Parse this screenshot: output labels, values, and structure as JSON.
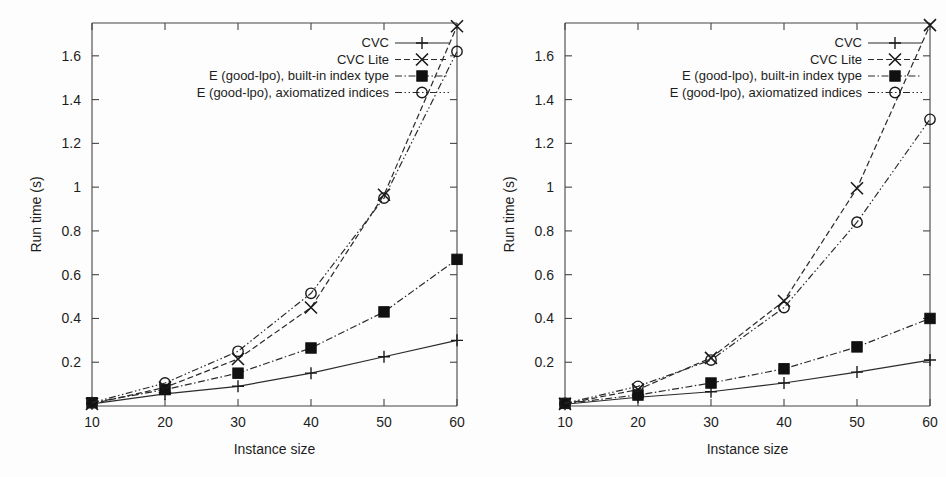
{
  "figure": {
    "background": "#fdfdfd",
    "ink_color": "#1d1d1d",
    "panel_count": 2
  },
  "legend": {
    "entries": [
      {
        "label": "CVC",
        "marker": "plus",
        "line_style": "solid"
      },
      {
        "label": "CVC Lite",
        "marker": "cross",
        "line_style": "dashed"
      },
      {
        "label": "E (good-lpo), built-in index type",
        "marker": "filled-square",
        "line_style": "dash-dot"
      },
      {
        "label": "E (good-lpo), axiomatized indices",
        "marker": "open-circle",
        "line_style": "dash-dot-dot"
      }
    ]
  },
  "chart_data": [
    {
      "panel": "left",
      "type": "line",
      "title": "",
      "xlabel": "Instance size",
      "ylabel": "Run time (s)",
      "x": [
        10,
        20,
        30,
        40,
        50,
        60
      ],
      "xticklabels": [
        "10",
        "20",
        "30",
        "40",
        "50",
        "60"
      ],
      "xlim": [
        10,
        60
      ],
      "ylim": [
        0,
        1.75
      ],
      "yticks": [
        0.2,
        0.4,
        0.6,
        0.8,
        1,
        1.2,
        1.4,
        1.6
      ],
      "yticklabels": [
        "0.2",
        "0.4",
        "0.6",
        "0.8",
        "1",
        "1.2",
        "1.4",
        "1.6"
      ],
      "grid": false,
      "legend_position": "top-right inside",
      "series": [
        {
          "name": "CVC",
          "marker": "plus",
          "line_style": "solid",
          "values": [
            0.01,
            0.055,
            0.09,
            0.15,
            0.225,
            0.3
          ]
        },
        {
          "name": "CVC Lite",
          "marker": "cross",
          "line_style": "dashed",
          "values": [
            0.01,
            0.085,
            0.215,
            0.45,
            0.965,
            1.735
          ]
        },
        {
          "name": "E (good-lpo), built-in index type",
          "marker": "filled-square",
          "line_style": "dash-dot",
          "values": [
            0.015,
            0.075,
            0.15,
            0.265,
            0.43,
            0.67
          ]
        },
        {
          "name": "E (good-lpo), axiomatized indices",
          "marker": "open-circle",
          "line_style": "dash-dot-dot",
          "values": [
            0.015,
            0.105,
            0.25,
            0.515,
            0.95,
            1.62
          ]
        }
      ]
    },
    {
      "panel": "right",
      "type": "line",
      "title": "",
      "xlabel": "Instance size",
      "ylabel": "Run time (s)",
      "x": [
        10,
        20,
        30,
        40,
        50,
        60
      ],
      "xticklabels": [
        "10",
        "20",
        "30",
        "40",
        "50",
        "60"
      ],
      "xlim": [
        10,
        60
      ],
      "ylim": [
        0,
        1.75
      ],
      "yticks": [
        0.2,
        0.4,
        0.6,
        0.8,
        1,
        1.2,
        1.4,
        1.6
      ],
      "yticklabels": [
        "0.2",
        "0.4",
        "0.6",
        "0.8",
        "1",
        "1.2",
        "1.4",
        "1.6"
      ],
      "grid": false,
      "legend_position": "top-right inside",
      "series": [
        {
          "name": "CVC",
          "marker": "plus",
          "line_style": "solid",
          "values": [
            0.008,
            0.04,
            0.065,
            0.105,
            0.155,
            0.21
          ]
        },
        {
          "name": "CVC Lite",
          "marker": "cross",
          "line_style": "dashed",
          "values": [
            0.01,
            0.075,
            0.22,
            0.48,
            0.995,
            1.74
          ]
        },
        {
          "name": "E (good-lpo), built-in index type",
          "marker": "filled-square",
          "line_style": "dash-dot",
          "values": [
            0.012,
            0.05,
            0.105,
            0.17,
            0.27,
            0.4
          ]
        },
        {
          "name": "E (good-lpo), axiomatized indices",
          "marker": "open-circle",
          "line_style": "dash-dot-dot",
          "values": [
            0.012,
            0.09,
            0.21,
            0.45,
            0.84,
            1.31
          ]
        }
      ]
    }
  ]
}
